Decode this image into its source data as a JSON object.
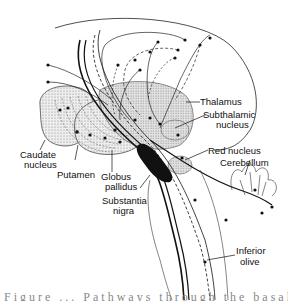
{
  "figure": {
    "labels": {
      "thalamus": "Thalamus",
      "subthalamic_1": "Subthalamic",
      "subthalamic_2": "nucleus",
      "caudate_1": "Caudate",
      "caudate_2": "nucleus",
      "putamen": "Putamen",
      "globus_1": "Globus",
      "globus_2": "pallidus",
      "red_nucleus": "Red nucleus",
      "cerebellum": "Cerebellum",
      "substantia_1": "Substantia",
      "substantia_2": "nigra",
      "inferior_1": "Inferior",
      "inferior_2": "olive"
    },
    "caption": "Figure ... Pathways through the basal ganglia and"
  },
  "colors": {
    "ink": "#111111",
    "stipple": "#d8d8d8",
    "background": "#ffffff"
  }
}
